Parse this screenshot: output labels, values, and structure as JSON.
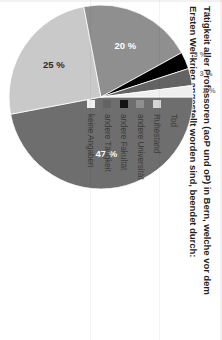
{
  "title": "Tätigkeit aller Professoren (aoP und oP) in Bern, welche vor dem Ersten Wel-krieg angestellt worden sind, beendet durch:",
  "chart_data": {
    "type": "pie",
    "title": "Tätigkeit aller Professoren (aoP und oP) in Bern, welche vor dem Ersten Wel-krieg angestellt worden sind, beendet durch:",
    "xlabel": "",
    "ylabel": "",
    "unit": "%",
    "legend_position": "top-right",
    "grid": false,
    "categories": [
      "Tod",
      "Ruhestand",
      "andere Universität",
      "andere Fakultät",
      "andere Tätigkeit",
      "keine Angaben"
    ],
    "values": [
      47,
      25,
      20,
      3,
      3,
      2
    ],
    "labels": [
      "47 %",
      "25 %",
      "20 %",
      "3 %",
      "3 %",
      "2 %"
    ],
    "colors": [
      "#6e6e6e",
      "#c9c9c9",
      "#8f8f8f",
      "#000000",
      "#636363",
      "#efefef"
    ],
    "label_placement": [
      "inside",
      "inside",
      "inside",
      "outside",
      "outside",
      "outside"
    ]
  },
  "legend": {
    "items": [
      {
        "label": "Tod",
        "color": "#6e6e6e"
      },
      {
        "label": "Ruhestand",
        "color": "#d5d5d5"
      },
      {
        "label": "andere Universität",
        "color": "#8f8f8f"
      },
      {
        "label": "andere Fakultät",
        "color": "#141414"
      },
      {
        "label": "andere Tätigkeit",
        "color": "#636363"
      },
      {
        "label": "keine Angaben",
        "color": "#f0f0f0"
      }
    ]
  }
}
